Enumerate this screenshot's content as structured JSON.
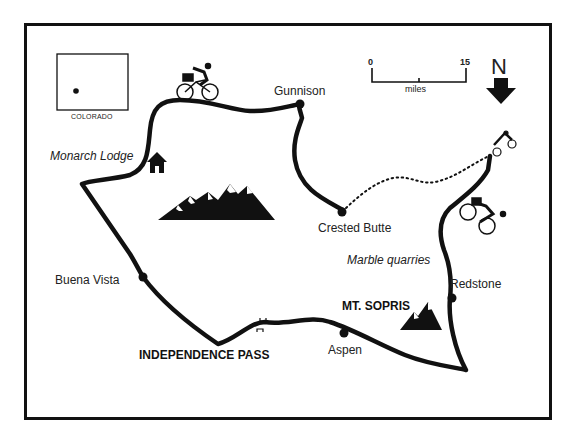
{
  "map": {
    "inset": {
      "label": "COLORADO"
    },
    "scale": {
      "start": "0",
      "end": "15",
      "unit": "miles"
    },
    "north": {
      "label": "N"
    },
    "places": {
      "gunnison": "Gunnison",
      "crested_butte": "Crested Butte",
      "monarch_lodge": "Monarch Lodge",
      "buena_vista": "Buena Vista",
      "independence_pass": "INDEPENDENCE PASS",
      "aspen": "Aspen",
      "mt_sopris": "MT. SOPRIS",
      "redstone": "Redstone",
      "marble_quarries": "Marble quarries"
    },
    "icons": [
      "cyclist-icon",
      "lodge-house-icon",
      "mountain-range-icon",
      "mountain-peak-icon",
      "north-arrow-icon",
      "bridge-icon",
      "town-dot-icon"
    ],
    "colors": {
      "ink": "#111111",
      "background": "#ffffff"
    }
  }
}
